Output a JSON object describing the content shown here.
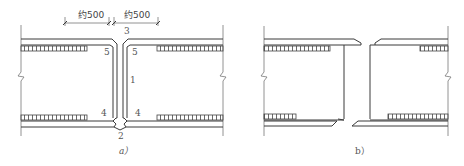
{
  "figure": {
    "panel_a": {
      "caption": "a）",
      "dimensions": [
        "约500",
        "约500"
      ],
      "labels": {
        "top_gap": "3",
        "top_left": "5",
        "top_right": "5",
        "center": "1",
        "bottom_left": "4",
        "bottom_right": "4",
        "bottom_gap": "2"
      }
    },
    "panel_b": {
      "caption": "b）"
    },
    "colors": {
      "line": "#3a3a3a",
      "text": "#555555"
    }
  }
}
